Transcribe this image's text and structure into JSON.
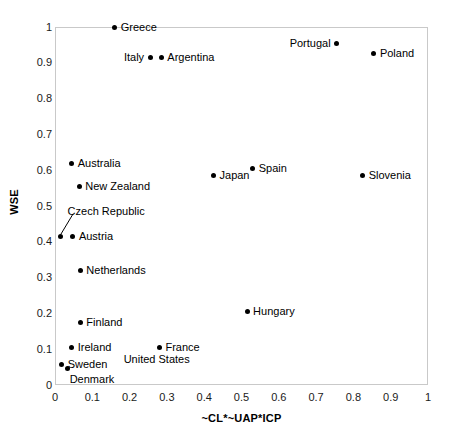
{
  "chart_data": {
    "type": "scatter",
    "title": "",
    "xlabel": "~CL*~UAP*ICP",
    "ylabel": "WSE",
    "xlim": [
      0,
      1
    ],
    "ylim": [
      0,
      1
    ],
    "grid": false,
    "legend": "none",
    "xticks": [
      "0",
      "0.1",
      "0.2",
      "0.3",
      "0.4",
      "0.5",
      "0.6",
      "0.7",
      "0.8",
      "0.9",
      "1"
    ],
    "xtick_values": [
      0,
      0.1,
      0.2,
      0.3,
      0.4,
      0.5,
      0.6,
      0.7,
      0.8,
      0.9,
      1
    ],
    "yticks": [
      "0",
      "0.1",
      "0.2",
      "0.3",
      "0.4",
      "0.5",
      "0.6",
      "0.7",
      "0.8",
      "0.9",
      "1"
    ],
    "ytick_values": [
      0,
      0.1,
      0.2,
      0.3,
      0.4,
      0.5,
      0.6,
      0.7,
      0.8,
      0.9,
      1
    ],
    "marker_color": "#000000",
    "frame_color": "#c9c9c9",
    "points": [
      {
        "label": "Greece",
        "x": 0.16,
        "y": 1.0,
        "label_pos": "right"
      },
      {
        "label": "Portugal",
        "x": 0.755,
        "y": 0.955,
        "label_pos": "left"
      },
      {
        "label": "Poland",
        "x": 0.855,
        "y": 0.925,
        "label_pos": "right"
      },
      {
        "label": "Italy",
        "x": 0.255,
        "y": 0.915,
        "label_pos": "left"
      },
      {
        "label": "Argentina",
        "x": 0.285,
        "y": 0.915,
        "label_pos": "right"
      },
      {
        "label": "Australia",
        "x": 0.045,
        "y": 0.62,
        "label_pos": "right"
      },
      {
        "label": "Spain",
        "x": 0.53,
        "y": 0.605,
        "label_pos": "right"
      },
      {
        "label": "Japan",
        "x": 0.425,
        "y": 0.585,
        "label_pos": "right"
      },
      {
        "label": "Slovenia",
        "x": 0.825,
        "y": 0.585,
        "label_pos": "right"
      },
      {
        "label": "New Zealand",
        "x": 0.065,
        "y": 0.555,
        "label_pos": "right"
      },
      {
        "label": "Czech Republic",
        "x": 0.015,
        "y": 0.415,
        "label_pos": "leader"
      },
      {
        "label": "Austria",
        "x": 0.048,
        "y": 0.415,
        "label_pos": "right"
      },
      {
        "label": "Netherlands",
        "x": 0.068,
        "y": 0.32,
        "label_pos": "right"
      },
      {
        "label": "Hungary",
        "x": 0.515,
        "y": 0.205,
        "label_pos": "right"
      },
      {
        "label": "Finland",
        "x": 0.068,
        "y": 0.175,
        "label_pos": "right"
      },
      {
        "label": "Ireland",
        "x": 0.045,
        "y": 0.105,
        "label_pos": "right"
      },
      {
        "label": "France",
        "x": 0.28,
        "y": 0.105,
        "label_pos": "right"
      },
      {
        "label": "Sweden",
        "x": 0.018,
        "y": 0.057,
        "label_pos": "right"
      },
      {
        "label": "United States",
        "x": 0.034,
        "y": 0.045,
        "label_pos": "us"
      },
      {
        "label": "Denmark",
        "x": 0.034,
        "y": 0.045,
        "label_pos": "below-right"
      }
    ]
  }
}
